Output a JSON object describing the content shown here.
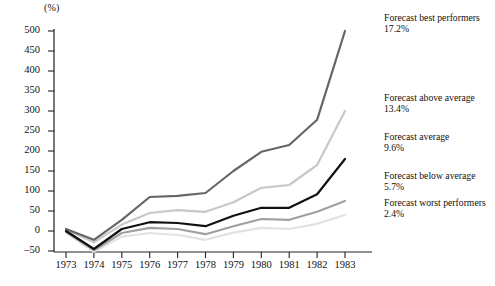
{
  "chart_data": {
    "type": "line",
    "title": "",
    "xlabel": "",
    "ylabel": "(%)",
    "unit_label": "(%)",
    "x": [
      1973,
      1974,
      1975,
      1976,
      1977,
      1978,
      1979,
      1980,
      1981,
      1982,
      1983
    ],
    "categories": [
      "1973",
      "1974",
      "1975",
      "1976",
      "1977",
      "1978",
      "1979",
      "1980",
      "1981",
      "1982",
      "1983"
    ],
    "xlim": [
      1973,
      1983
    ],
    "ylim": [
      -50,
      500
    ],
    "yticks": [
      500,
      450,
      400,
      350,
      300,
      250,
      200,
      150,
      100,
      50,
      0,
      -50
    ],
    "ytick_labels": [
      "500",
      "450",
      "400",
      "350",
      "300",
      "250",
      "200",
      "150",
      "100",
      "50",
      "0",
      "–50"
    ],
    "grid": false,
    "legend_position": "right-inline-labels",
    "series": [
      {
        "name": "Forecast best performers",
        "value_label": "17.2%",
        "color": "#666666",
        "width": 2.2,
        "values": [
          5,
          -22,
          28,
          85,
          88,
          95,
          150,
          198,
          215,
          278,
          500
        ]
      },
      {
        "name": "Forecast above average",
        "value_label": "13.4%",
        "color": "#c8c8c8",
        "width": 2.2,
        "values": [
          3,
          -28,
          16,
          45,
          52,
          48,
          72,
          108,
          115,
          165,
          300
        ]
      },
      {
        "name": "Forecast average",
        "value_label": "9.6%",
        "color": "#111111",
        "width": 2.2,
        "values": [
          0,
          -45,
          5,
          22,
          20,
          12,
          38,
          58,
          58,
          92,
          180
        ]
      },
      {
        "name": "Forecast below average",
        "value_label": "5.7%",
        "color": "#a0a0a0",
        "width": 2.2,
        "values": [
          -2,
          -48,
          -5,
          8,
          5,
          -8,
          12,
          30,
          28,
          48,
          75
        ]
      },
      {
        "name": "Forecast worst performers",
        "value_label": "2.4%",
        "color": "#e2e2e2",
        "width": 2.2,
        "values": [
          -4,
          -52,
          -14,
          -5,
          -10,
          -22,
          -4,
          8,
          5,
          18,
          40
        ]
      }
    ]
  },
  "legend": [
    {
      "label": "Forecast best performers",
      "value": "17.2%"
    },
    {
      "label": "Forecast above average",
      "value": "13.4%"
    },
    {
      "label": "Forecast average",
      "value": "9.6%"
    },
    {
      "label": "Forecast below average",
      "value": "5.7%"
    },
    {
      "label": "Forecast worst performers",
      "value": "2.4%"
    }
  ]
}
